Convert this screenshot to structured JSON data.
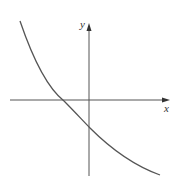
{
  "diagram": {
    "type": "function-graph",
    "axes": {
      "x_label": "x",
      "y_label": "y"
    },
    "curve": {
      "description": "decreasing convex curve crossing negative x-axis and negative y-intercept"
    },
    "colors": {
      "axis": "#555555",
      "curve": "#555555"
    }
  }
}
